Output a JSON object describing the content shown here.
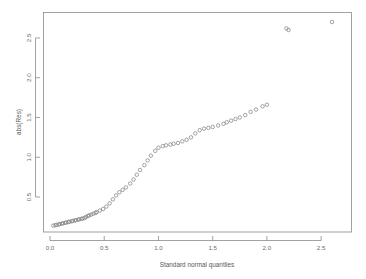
{
  "chart_data": {
    "type": "scatter",
    "title": "",
    "xlabel": "Standard normal quantiles",
    "ylabel": "abs(Res)",
    "xlim": [
      -0.06,
      2.78
    ],
    "ylim": [
      0.06,
      2.82
    ],
    "xticks": [
      0.0,
      0.5,
      1.0,
      1.5,
      2.0,
      2.5
    ],
    "xticklabels": [
      "0.0",
      "0.5",
      "1.0",
      "1.5",
      "2.0",
      "2.5"
    ],
    "yticks": [
      0.5,
      1.0,
      1.5,
      2.0,
      2.5
    ],
    "yticklabels": [
      "0.5",
      "1.0",
      "1.5",
      "2.0",
      "2.5"
    ],
    "grid": false,
    "legend": null,
    "marker": "open-circle",
    "marker_color": "#7d7d7d",
    "point_count": 72,
    "x": [
      0.03,
      0.06,
      0.09,
      0.12,
      0.15,
      0.18,
      0.21,
      0.24,
      0.27,
      0.3,
      0.33,
      0.36,
      0.4,
      0.43,
      0.46,
      0.49,
      0.52,
      0.55,
      0.58,
      0.61,
      0.64,
      0.67,
      0.7,
      0.74,
      0.77,
      0.8,
      0.83,
      0.87,
      0.9,
      0.93,
      0.97,
      1.0,
      1.04,
      1.07,
      1.11,
      1.14,
      1.18,
      1.22,
      1.26,
      1.3,
      1.34,
      1.38,
      1.42,
      1.46,
      1.5,
      1.55,
      1.6,
      1.63,
      1.67,
      1.71,
      1.75,
      1.8,
      1.85,
      1.9,
      1.96,
      2.0,
      2.18,
      2.2,
      2.6,
      0.05,
      0.08,
      0.11,
      0.14,
      0.17,
      0.2,
      0.23,
      0.26,
      0.29,
      0.32,
      0.35,
      0.38,
      0.42
    ],
    "y": [
      0.14,
      0.15,
      0.16,
      0.17,
      0.18,
      0.19,
      0.2,
      0.21,
      0.22,
      0.23,
      0.25,
      0.27,
      0.29,
      0.31,
      0.33,
      0.35,
      0.38,
      0.42,
      0.47,
      0.52,
      0.56,
      0.59,
      0.62,
      0.67,
      0.72,
      0.78,
      0.84,
      0.9,
      0.96,
      1.02,
      1.08,
      1.12,
      1.14,
      1.15,
      1.16,
      1.17,
      1.18,
      1.2,
      1.22,
      1.25,
      1.3,
      1.34,
      1.36,
      1.37,
      1.38,
      1.4,
      1.42,
      1.44,
      1.46,
      1.48,
      1.5,
      1.53,
      1.57,
      1.6,
      1.64,
      1.66,
      2.62,
      2.6,
      2.7,
      0.145,
      0.155,
      0.165,
      0.175,
      0.185,
      0.195,
      0.205,
      0.215,
      0.225,
      0.235,
      0.26,
      0.28,
      0.3
    ]
  }
}
